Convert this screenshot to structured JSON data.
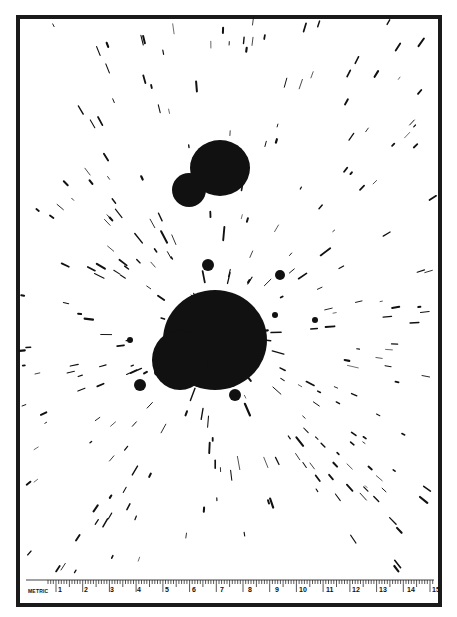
{
  "image": {
    "subject": "blood spatter pattern on white paper with metric ruler",
    "colors": {
      "ink": "#111111",
      "paper": "#ffffff",
      "frame": "#1a1a1a"
    }
  },
  "ruler": {
    "label": "METRIC",
    "numbers": [
      "1",
      "2",
      "3",
      "4",
      "5",
      "6",
      "7",
      "8",
      "9",
      "10",
      "11",
      "12",
      "13",
      "14",
      "15"
    ],
    "number_x": [
      56,
      82,
      108,
      135,
      163,
      190,
      218,
      246,
      273,
      297,
      324,
      350,
      377,
      405,
      430
    ]
  },
  "blobs": [
    {
      "name": "upper-large",
      "cx": 220,
      "cy": 168,
      "rx": 30,
      "ry": 28
    },
    {
      "name": "upper-small",
      "cx": 189,
      "cy": 190,
      "rx": 17,
      "ry": 17
    },
    {
      "name": "main",
      "cx": 215,
      "cy": 340,
      "rx": 52,
      "ry": 50
    },
    {
      "name": "main-lobe",
      "cx": 180,
      "cy": 360,
      "rx": 28,
      "ry": 30
    }
  ],
  "center": {
    "x": 215,
    "y": 335
  }
}
